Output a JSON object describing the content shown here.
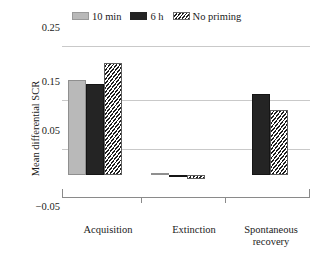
{
  "chart_data": {
    "type": "bar",
    "title": "",
    "xlabel": "",
    "ylabel": "Mean differential SCR",
    "ylim": [
      -0.05,
      0.25
    ],
    "yticks": [
      "0.25",
      "0.15",
      "0.05",
      "−0.05"
    ],
    "ytick_values": [
      0.25,
      0.15,
      0.05,
      -0.05
    ],
    "grid": true,
    "legend_position": "top",
    "categories": [
      "Acquisition",
      "Extinction",
      "Spontaneous recovery"
    ],
    "series": [
      {
        "name": "10 min",
        "color": "#b9b9b9",
        "fill": "solid-light-grey",
        "values": [
          0.184,
          0.004,
          0.0
        ]
      },
      {
        "name": "6 h",
        "color": "#242424",
        "fill": "solid-black",
        "values": [
          0.176,
          -0.002,
          0.156
        ]
      },
      {
        "name": "No priming",
        "color": "#1c1c1c",
        "fill": "diagonal-hatch",
        "values": [
          0.217,
          -0.008,
          0.126
        ]
      }
    ]
  },
  "legend": {
    "entries": [
      {
        "label": "10 min",
        "swatch": "legend-swatch-10min"
      },
      {
        "label": "6 h",
        "swatch": "legend-swatch-6h"
      },
      {
        "label": "No priming",
        "swatch": "legend-swatch-no-priming"
      }
    ]
  },
  "yaxis": {
    "title": "Mean differential SCR",
    "tick_025": "0.25",
    "tick_015": "0.15",
    "tick_005": "0.05",
    "tick_m005": "−0.05"
  },
  "xaxis": {
    "cat_1": "Acquisition",
    "cat_2": "Extinction",
    "cat_3_line1": "Spontaneous",
    "cat_3_line2": "recovery"
  }
}
